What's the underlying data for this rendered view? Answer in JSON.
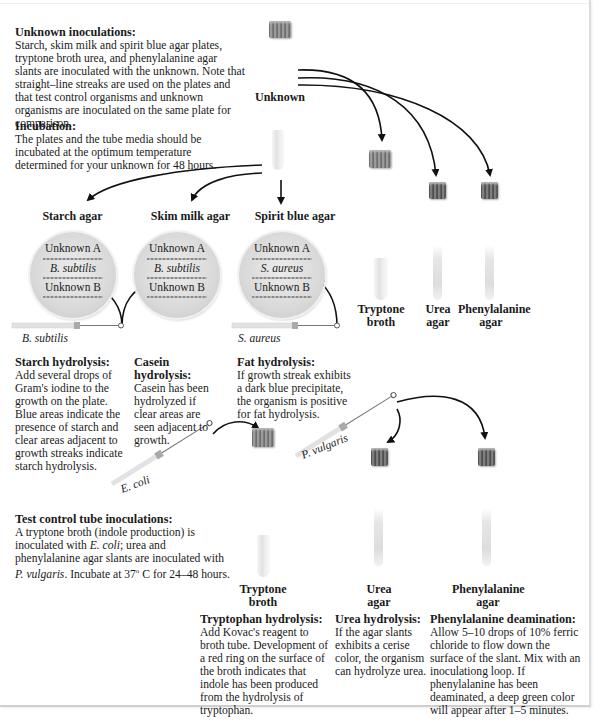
{
  "unknown_inoculations": {
    "heading": "Unknown inoculations:",
    "body": "Starch, skim milk and spirit blue agar plates, tryptone broth urea, and phenylalanine agar slants are inoculated with the unknown. Note that straight–line streaks are used on the plates and that test control organisms and unknown organisms are inoculated on the same plate for comparison."
  },
  "incubation": {
    "heading": "Incubation:",
    "body": "The plates and the tube media should be incubated at the optimum temperature determined for your unknown for 48 hours."
  },
  "unknown_label": "Unknown",
  "plates": [
    {
      "title": "Starch agar",
      "rows": [
        "Unknown A",
        "B. subtilis",
        "Unknown B"
      ]
    },
    {
      "title": "Skim milk agar",
      "rows": [
        "Unknown A",
        "B. subtilis",
        "Unknown B"
      ]
    },
    {
      "title": "Spirit blue agar",
      "rows": [
        "Unknown A",
        "S. aureus",
        "Unknown B"
      ]
    }
  ],
  "loops": {
    "b_subtilis": "B. subtilis",
    "s_aureus": "S. aureus",
    "e_coli": "E. coli",
    "p_vulgaris": "P. vulgaris"
  },
  "upper_tubes": [
    {
      "line1": "Tryptone",
      "line2": "broth"
    },
    {
      "line1": "Urea",
      "line2": "agar"
    },
    {
      "line1": "Phenylalanine",
      "line2": "agar"
    }
  ],
  "results": {
    "starch": {
      "heading": "Starch hydrolysis:",
      "body": "Add several drops of Gram's iodine to the growth on the plate. Blue areas indicate the presence of starch and clear areas adjacent to growth streaks indicate starch hydrolysis."
    },
    "casein": {
      "heading": "Casein hydrolysis:",
      "body": "Casein has been hydrolyzed if clear areas are seen adjacent to growth."
    },
    "fat": {
      "heading": "Fat hydrolysis:",
      "body": "If growth streak exhibits a dark blue precipitate, the organism is positive for fat hydrolysis."
    }
  },
  "test_control": {
    "heading": "Test control tube inoculations:",
    "body_parts": [
      "A tryptone broth (indole production) is inoculated with ",
      "E. coli",
      "; urea and phenylalanine agar slants are inoculated with ",
      "P. vulgaris",
      ". Incubate at 37",
      "o",
      " C   for 24–48 hours."
    ]
  },
  "lower_tubes": [
    {
      "line1": "Tryptone",
      "line2": "broth"
    },
    {
      "line1": "Urea",
      "line2": "agar"
    },
    {
      "line1": "Phenylalanine",
      "line2": "agar"
    }
  ],
  "lower_results": {
    "tryptophan": {
      "heading": "Tryptophan hydrolysis:",
      "body": "Add Kovac's reagent to broth tube. Development of a red ring on the surface of the broth indicates that indole has been produced from the hydrolysis of tryptophan."
    },
    "urea": {
      "heading": "Urea hydrolysis:",
      "body": "If the agar slants exhibits a cerise color, the organism can hydrolyze urea."
    },
    "phenylalanine": {
      "heading": "Phenylalanine deamination:",
      "body": "Allow 5–10 drops of 10% ferric chloride to flow down the surface of the slant. Mix with an inoculationg loop. If phenylalanine has been deaminated, a deep green color will appear after 1–5 minutes."
    }
  }
}
